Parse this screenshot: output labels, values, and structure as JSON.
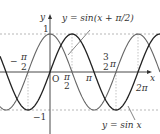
{
  "diagram": {
    "axes": {
      "x_label": "x",
      "y_label": "y",
      "origin_label": "O"
    },
    "y_ticks": [
      {
        "label": "1",
        "value": 1
      },
      {
        "label": "−1",
        "value": -1
      }
    ],
    "x_ticks": [
      {
        "num": "π",
        "den": "2",
        "sign": "−",
        "value": "-pi/2"
      },
      {
        "num": "π",
        "den": "2",
        "sign": "",
        "value": "pi/2"
      },
      {
        "label": "π",
        "value": "pi"
      },
      {
        "num": "3",
        "den": "2",
        "suffix": "π",
        "value": "3pi/2"
      },
      {
        "label": "2π",
        "value": "2pi"
      }
    ],
    "curves": [
      {
        "name": "sin x",
        "label": "y = sin x",
        "color": "#222222"
      },
      {
        "name": "sin(x+π/2)",
        "label": "y = sin(x + π/2)",
        "color": "#666666"
      }
    ],
    "colors": {
      "axis": "#333333",
      "dashed": "#999999"
    }
  }
}
